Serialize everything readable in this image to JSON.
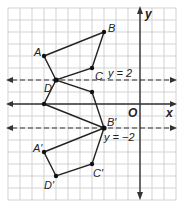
{
  "diagram": {
    "type": "coordinate-plane-reflection",
    "axes": {
      "x_label": "x",
      "y_label": "y",
      "origin_label": "O"
    },
    "reference_lines": [
      {
        "label": "y = 2",
        "y": 2,
        "style": "dashed"
      },
      {
        "label": "y = −2",
        "y": -2,
        "style": "dashed"
      }
    ],
    "original_figure": {
      "points": [
        {
          "label": "A",
          "x": -8,
          "y": 4
        },
        {
          "label": "B",
          "x": -3,
          "y": 6
        },
        {
          "label": "C",
          "x": -4,
          "y": 3
        },
        {
          "label": "D",
          "x": -7,
          "y": 2
        }
      ]
    },
    "intermediate_figure": {
      "points": [
        {
          "label": "",
          "x": -8,
          "y": 0
        },
        {
          "label": "",
          "x": -3,
          "y": -2
        },
        {
          "label": "",
          "x": -4,
          "y": 1
        },
        {
          "label": "",
          "x": -7,
          "y": 2
        }
      ]
    },
    "image_figure": {
      "points": [
        {
          "label": "A′",
          "x": -8,
          "y": -4
        },
        {
          "label": "B′",
          "x": -3,
          "y": -2
        },
        {
          "label": "C′",
          "x": -4,
          "y": -5
        },
        {
          "label": "D′",
          "x": -7,
          "y": -6
        }
      ]
    }
  }
}
